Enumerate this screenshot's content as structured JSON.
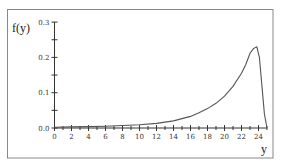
{
  "chart_data": {
    "type": "line",
    "title": "",
    "xlabel": "y",
    "ylabel": "f(y)",
    "xlim": [
      0,
      25
    ],
    "ylim": [
      0,
      0.3
    ],
    "x_ticks": [
      0,
      2,
      4,
      6,
      8,
      10,
      12,
      14,
      16,
      18,
      20,
      22,
      24
    ],
    "x_tick_labels": [
      "0",
      "2",
      "4",
      "6",
      "8",
      "10",
      "12",
      "14",
      "16",
      "18",
      "20",
      "22",
      "24"
    ],
    "y_ticks": [
      0.0,
      0.1,
      0.2,
      0.3
    ],
    "y_tick_labels": [
      "0.0",
      "0.1",
      "0.2",
      "0.3"
    ],
    "grid": false,
    "legend": null,
    "series": [
      {
        "name": "f(y)",
        "color": "#555555",
        "x": [
          0,
          2,
          4,
          6,
          8,
          10,
          12,
          14,
          16,
          17,
          18,
          19,
          20,
          21,
          22,
          22.5,
          23,
          23.4,
          23.8,
          24.1,
          24.4,
          24.7,
          25
        ],
        "y": [
          0.002,
          0.003,
          0.004,
          0.005,
          0.007,
          0.009,
          0.013,
          0.02,
          0.033,
          0.043,
          0.055,
          0.07,
          0.09,
          0.118,
          0.155,
          0.18,
          0.212,
          0.225,
          0.23,
          0.2,
          0.12,
          0.04,
          0.0
        ]
      }
    ]
  },
  "colors": {
    "frame": "#888888",
    "axis": "#333333",
    "curve": "#555555"
  }
}
